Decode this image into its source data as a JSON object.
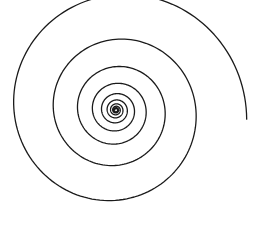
{
  "figure": {
    "type": "logarithmic-spiral",
    "width": 260,
    "height": 238,
    "background": "#ffffff",
    "stroke": "#1a1a1a",
    "stroke_width": 1.3,
    "center": {
      "x": 116,
      "y": 110
    },
    "end_radius": 131,
    "end_angle_deg": -4,
    "growth_per_turn": 1.63,
    "turns": 9.5,
    "direction": "counter-clockwise-outward"
  }
}
